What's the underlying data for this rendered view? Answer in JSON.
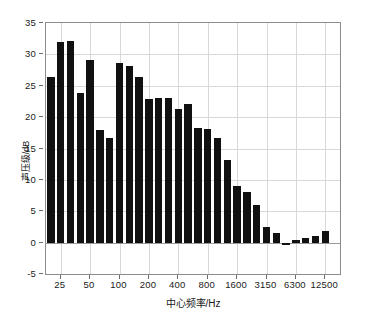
{
  "chart_data": {
    "type": "bar",
    "title": "",
    "xlabel": "中心频率/Hz",
    "ylabel": "声压级/dB",
    "ylim": [
      -5,
      35
    ],
    "yticks": [
      35,
      30,
      25,
      20,
      15,
      10,
      5,
      0,
      -5
    ],
    "xticks": [
      "25",
      "50",
      "100",
      "200",
      "400",
      "800",
      "1600",
      "3150",
      "6300",
      "12500"
    ],
    "grid": true,
    "legend": null,
    "bar_color": "#111111",
    "categories": [
      "20",
      "25",
      "31.5",
      "40",
      "50",
      "63",
      "80",
      "100",
      "125",
      "160",
      "200",
      "250",
      "315",
      "400",
      "500",
      "630",
      "800",
      "1000",
      "1250",
      "1600",
      "2000",
      "2500",
      "3150",
      "4000",
      "5000",
      "6300",
      "8000",
      "10000",
      "12500",
      "16000"
    ],
    "values": [
      26.4,
      31.9,
      32.1,
      23.8,
      29.1,
      17.9,
      16.6,
      28.7,
      28.2,
      26.4,
      22.9,
      23.0,
      23.1,
      21.3,
      22.1,
      18.3,
      18.1,
      16.6,
      13.2,
      9.1,
      8.0,
      6.0,
      2.5,
      1.5,
      -0.3,
      0.4,
      0.8,
      1.1,
      1.8,
      0
    ]
  }
}
